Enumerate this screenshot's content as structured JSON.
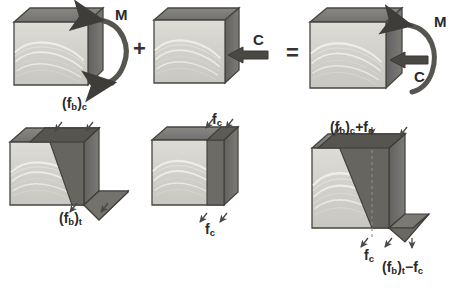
{
  "figure": {
    "type": "engineering-diagram",
    "background": "#ffffff"
  },
  "palette": {
    "front_face": "#d4d2cd",
    "front_face_light": "#e2e0db",
    "side_face": "#6e6c68",
    "top_face": "#807e7a",
    "wedge_dark": "#5e5c58",
    "wedge_mid": "#76746f",
    "outline": "#4a4845",
    "grain": "#efeee9",
    "arrow": "#4a4845",
    "text": "#2a2a2a"
  },
  "operators": {
    "plus": "+",
    "equals": "="
  },
  "row_top": {
    "label": "force system superposition",
    "blocks": [
      {
        "id": "block-moment",
        "name": "block-bending-moment",
        "loads": [
          {
            "id": "load-moment",
            "symbol": "M",
            "kind": "moment-curved-arrow"
          }
        ]
      },
      {
        "id": "block-axial",
        "name": "block-axial-compression",
        "loads": [
          {
            "id": "load-compression",
            "symbol": "C",
            "kind": "axial-straight-arrow"
          }
        ]
      },
      {
        "id": "block-combined",
        "name": "block-combined-loading",
        "loads": [
          {
            "id": "load-moment-combined",
            "symbol": "M",
            "kind": "moment-curved-arrow"
          },
          {
            "id": "load-compression-combined",
            "symbol": "C",
            "kind": "axial-straight-arrow"
          }
        ]
      }
    ]
  },
  "row_bottom": {
    "label": "stress distribution superposition",
    "blocks": [
      {
        "id": "stress-bending",
        "name": "stress-block-bending",
        "labels": [
          {
            "id": "fb-c",
            "base": "(f",
            "sub1": "b",
            "mid": ")",
            "sub2": "c",
            "tail": "",
            "text": "(fb)c",
            "x": 62,
            "y": 99,
            "size": 13
          },
          {
            "id": "fb-t",
            "base": "(f",
            "sub1": "b",
            "mid": ")",
            "sub2": "t",
            "tail": "",
            "text": "(fb)t",
            "x": 62,
            "y": 213,
            "size": 13
          }
        ]
      },
      {
        "id": "stress-axial",
        "name": "stress-block-axial",
        "labels": [
          {
            "id": "fc-top",
            "base": "f",
            "sub1": "c",
            "mid": "",
            "sub2": "",
            "tail": "",
            "text": "fc",
            "x": 213,
            "y": 114,
            "size": 13
          },
          {
            "id": "fc-bottom",
            "base": "f",
            "sub1": "c",
            "mid": "",
            "sub2": "",
            "tail": "",
            "text": "fc",
            "x": 205,
            "y": 224,
            "size": 13
          }
        ]
      },
      {
        "id": "stress-combined",
        "name": "stress-block-combined",
        "labels": [
          {
            "id": "fb-c-plus-fc",
            "base": "(f",
            "sub1": "b",
            "mid": ")",
            "sub2": "c",
            "tail": "+f",
            "sub3": "c",
            "text": "(fb)c+fc",
            "x": 330,
            "y": 123,
            "size": 13
          },
          {
            "id": "fc-combined",
            "base": "f",
            "sub1": "c",
            "mid": "",
            "sub2": "",
            "tail": "",
            "text": "fc",
            "x": 364,
            "y": 251,
            "size": 13
          },
          {
            "id": "fb-t-minus-fc",
            "base": "(f",
            "sub1": "b",
            "mid": ")",
            "sub2": "t",
            "tail": "−f",
            "sub3": "c",
            "text": "(fb)t−fc",
            "x": 382,
            "y": 261,
            "size": 13
          }
        ]
      }
    ]
  },
  "symbols": {
    "moment_top_left": "M",
    "compression_top_mid": "C",
    "moment_top_right": "M",
    "compression_top_right": "C"
  }
}
